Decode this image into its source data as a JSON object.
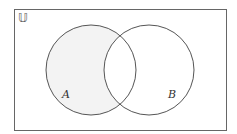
{
  "diagram": {
    "type": "venn",
    "universe_label": "𝕌",
    "sets": [
      {
        "label": "A",
        "cx": 91,
        "cy": 70,
        "r": 45
      },
      {
        "label": "B",
        "cx": 149,
        "cy": 70,
        "r": 45
      }
    ],
    "shaded_region": "A only (A minus B)",
    "colors": {
      "stroke": "#555555",
      "shade": "#f3f3f3",
      "background": "#ffffff"
    }
  }
}
